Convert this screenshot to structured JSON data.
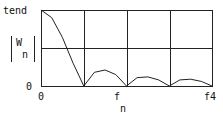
{
  "chart_data": {
    "type": "line",
    "title": "",
    "xlabel": "f",
    "xlabel_sub": "n",
    "ylabel": "|W",
    "ylabel_sub": "n|",
    "y_tick_labels": {
      "top": "tend",
      "bottom": "0"
    },
    "x_tick_labels": {
      "left": "0",
      "middle": "f",
      "middle_sub": "n",
      "right": "f4"
    },
    "grid": true,
    "grid_x_divisions": 4,
    "grid_y_divisions": 2,
    "x": [
      0,
      0.25,
      0.5,
      0.75,
      1.0,
      1.25,
      1.5,
      1.75,
      2.0,
      2.25,
      2.5,
      2.75,
      3.0,
      3.25,
      3.5,
      3.75,
      4.0
    ],
    "values": [
      1.0,
      0.9,
      0.64,
      0.3,
      0.0,
      0.18,
      0.21,
      0.15,
      0.0,
      0.11,
      0.12,
      0.08,
      0.0,
      0.08,
      0.09,
      0.06,
      0.0
    ],
    "xlim": [
      0,
      4
    ],
    "ylim": [
      0,
      1
    ]
  },
  "labels": {
    "y_top": "tend",
    "y_bottom": "0",
    "y_axis_main": "W",
    "y_axis_sub": "n",
    "x_left": "0",
    "x_mid": "f",
    "x_mid_sub": "n",
    "x_right": "f4"
  }
}
